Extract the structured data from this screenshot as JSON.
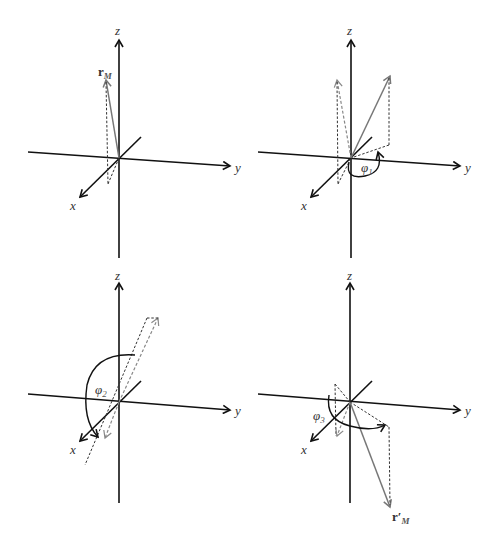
{
  "figure": {
    "axis_labels": {
      "x": "x",
      "y": "y",
      "z": "z"
    },
    "panels": [
      {
        "id": 1,
        "vector_label": "r",
        "vector_subscript": "M",
        "angle_label": ""
      },
      {
        "id": 2,
        "vector_label": "",
        "angle_label": "φ",
        "angle_subscript": "1"
      },
      {
        "id": 3,
        "vector_label": "",
        "angle_label": "φ",
        "angle_subscript": "2"
      },
      {
        "id": 4,
        "vector_label": "r′",
        "vector_subscript": "M",
        "angle_label": "φ",
        "angle_subscript": "3"
      }
    ]
  },
  "colors": {
    "axis": "#111111",
    "vector": "#777777",
    "dashed": "#333333"
  }
}
